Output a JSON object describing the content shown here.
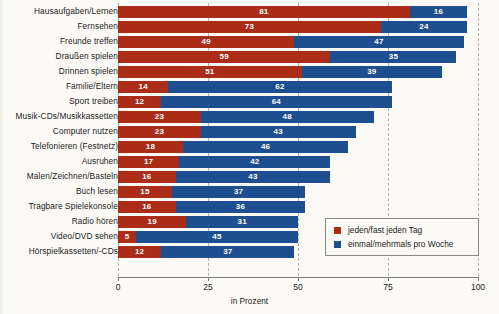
{
  "chart_data": {
    "type": "bar",
    "orientation": "horizontal",
    "stacked": true,
    "title": "",
    "xlabel": "in Prozent",
    "ylabel": "",
    "xlim": [
      0,
      100
    ],
    "xticks": [
      "0",
      "25",
      "50",
      "75",
      "100"
    ],
    "grid": true,
    "legend_position": "bottom-right",
    "categories": [
      "Hausaufgaben/Lernen",
      "Fernsehen",
      "Freunde treffen",
      "Draußen spielen",
      "Drinnen spielen",
      "Familie/Eltern",
      "Sport treiben",
      "Musik-CDs/Musikkassetten",
      "Computer nutzen",
      "Telefonieren (Festnetz)",
      "Ausruhen",
      "Malen/Zeichnen/Basteln",
      "Buch lesen",
      "Tragbare Spielekonsole",
      "Radio hören",
      "Video/DVD sehen",
      "Hörspielkassetten/-CDs"
    ],
    "series": [
      {
        "name": "jeden/fast jeden Tag",
        "color": "#ab2d17",
        "values": [
          81,
          73,
          49,
          59,
          51,
          14,
          12,
          23,
          23,
          18,
          17,
          16,
          15,
          16,
          19,
          5,
          12
        ]
      },
      {
        "name": "einmal/mehrmals pro Woche",
        "color": "#1d4f90",
        "values": [
          16,
          24,
          47,
          35,
          39,
          62,
          64,
          48,
          43,
          46,
          42,
          43,
          37,
          36,
          31,
          45,
          37
        ]
      }
    ]
  },
  "legend": {
    "items": [
      {
        "label": "jeden/fast jeden Tag",
        "color": "#ab2d17"
      },
      {
        "label": "einmal/mehrmals pro Woche",
        "color": "#1d4f90"
      }
    ]
  },
  "axis": {
    "title": "in Prozent",
    "ticks": [
      "0",
      "25",
      "50",
      "75",
      "100"
    ]
  }
}
